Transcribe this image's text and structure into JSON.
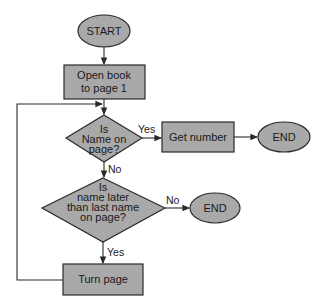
{
  "diagram": {
    "type": "flowchart",
    "colors": {
      "shape_fill": "#a9a9a9",
      "stroke": "#2a2a2a",
      "background": "#ffffff"
    },
    "nodes": {
      "start": {
        "shape": "terminator",
        "label": "START"
      },
      "open_book": {
        "shape": "process",
        "line1": "Open book",
        "line2": "to page 1"
      },
      "decision_name_on_page": {
        "shape": "decision",
        "line1": "Is",
        "line2": "Name on",
        "line3": "page?"
      },
      "get_number": {
        "shape": "process",
        "label": "Get number"
      },
      "end_found": {
        "shape": "terminator",
        "label": "END"
      },
      "decision_name_later": {
        "shape": "decision",
        "line1": "Is",
        "line2": "name later",
        "line3": "than last name",
        "line4": "on page?"
      },
      "end_not_found": {
        "shape": "terminator",
        "label": "END"
      },
      "turn_page": {
        "shape": "process",
        "label": "Turn page"
      }
    },
    "edges": {
      "yes_to_get_number": "Yes",
      "no_to_decision2": "No",
      "no_to_end": "No",
      "yes_to_turn_page": "Yes"
    }
  }
}
